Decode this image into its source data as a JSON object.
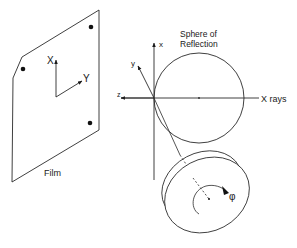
{
  "diagram": {
    "film": {
      "label": "Film",
      "axis_x_label": "X",
      "axis_y_label": "Y",
      "spots": 3
    },
    "crystal_axes": {
      "x_label": "x",
      "y_label": "y",
      "z_label": "z"
    },
    "sphere": {
      "label_line1": "Sphere of",
      "label_line2": "Reflection"
    },
    "beam": {
      "label": "X rays"
    },
    "rotation": {
      "symbol": "φ"
    },
    "colors": {
      "line": "#2a2a2a",
      "background": "#ffffff"
    }
  }
}
